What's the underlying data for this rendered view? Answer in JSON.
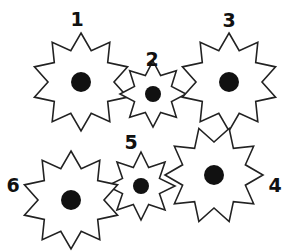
{
  "diagram": {
    "stroke_color": "#222222",
    "fill_color": "#ffffff",
    "hub_color": "#111111",
    "gears": [
      {
        "id": 1,
        "label": "1",
        "cx": 81,
        "cy": 82,
        "points": 10,
        "outer_r": 49,
        "inner_r": 33,
        "rotation": -90,
        "hub_r": 10,
        "label_x": 77,
        "label_y": 19
      },
      {
        "id": 2,
        "label": "2",
        "cx": 153,
        "cy": 94,
        "points": 8,
        "outer_r": 33,
        "inner_r": 20,
        "rotation": -90,
        "hub_r": 8,
        "label_x": 152,
        "label_y": 59
      },
      {
        "id": 3,
        "label": "3",
        "cx": 229,
        "cy": 82,
        "points": 10,
        "outer_r": 49,
        "inner_r": 33,
        "rotation": -90,
        "hub_r": 10,
        "label_x": 229,
        "label_y": 20
      },
      {
        "id": 4,
        "label": "4",
        "cx": 214,
        "cy": 175,
        "points": 10,
        "outer_r": 49,
        "inner_r": 33,
        "rotation": -72,
        "hub_r": 10,
        "label_x": 275,
        "label_y": 185
      },
      {
        "id": 5,
        "label": "5",
        "cx": 141,
        "cy": 186,
        "points": 8,
        "outer_r": 34,
        "inner_r": 20,
        "rotation": -90,
        "hub_r": 8,
        "label_x": 131,
        "label_y": 142
      },
      {
        "id": 6,
        "label": "6",
        "cx": 71,
        "cy": 200,
        "points": 10,
        "outer_r": 49,
        "inner_r": 33,
        "rotation": -90,
        "hub_r": 10,
        "label_x": 13,
        "label_y": 185
      }
    ]
  }
}
